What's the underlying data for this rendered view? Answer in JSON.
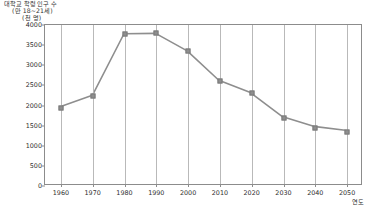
{
  "chart_data": {
    "type": "line",
    "title": "대학교 학령인구 수",
    "subtitle": "(만 18~21세)",
    "unit_label": "(천 명)",
    "xlabel": "연도",
    "ylabel": "",
    "categories": [
      "1960",
      "1970",
      "1980",
      "1990",
      "2000",
      "2010",
      "2020",
      "2030",
      "2040",
      "2050"
    ],
    "x": [
      1960,
      1970,
      1980,
      1990,
      2000,
      2010,
      2020,
      2030,
      2040,
      2050
    ],
    "values": [
      1950,
      2230,
      3780,
      3790,
      3350,
      2610,
      2300,
      1700,
      1450,
      1350
    ],
    "series": [
      {
        "name": "대학교 학령인구 수",
        "values": [
          1950,
          2230,
          3780,
          3790,
          3350,
          2610,
          2300,
          1700,
          1450,
          1350
        ]
      }
    ],
    "yticks": [
      0,
      500,
      1000,
      1500,
      2000,
      2500,
      3000,
      3500,
      4000
    ],
    "ytick_labels": [
      "0",
      "500",
      "1000",
      "1500",
      "2000",
      "2500",
      "3000",
      "3500",
      "4000"
    ],
    "ylim": [
      0,
      4000
    ],
    "xlim": [
      1955,
      2055
    ],
    "grid": "vertical",
    "legend": "none",
    "line_color": "#8e8e8e",
    "marker_color": "#8e8e8e",
    "axis_color": "#8c8c8c",
    "grid_color": "#b9b9b9"
  }
}
